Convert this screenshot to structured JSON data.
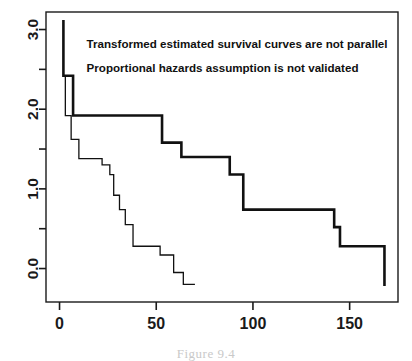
{
  "figure": {
    "caption_partial": "Figure 9.4",
    "annotations": [
      {
        "text": "Transformed estimated survival curves are not parallel",
        "x": 14,
        "y": 2.82
      },
      {
        "text": "Proportional hazards assumption is not validated",
        "x": 14,
        "y": 2.52
      }
    ]
  },
  "chart_data": {
    "type": "line",
    "title": "",
    "xlabel": "",
    "ylabel": "",
    "xlim": [
      -7,
      175
    ],
    "ylim": [
      -0.42,
      3.22
    ],
    "xticks": [
      0,
      50,
      100,
      150
    ],
    "yticks": [
      0.0,
      1.0,
      2.0,
      3.0
    ],
    "xtick_labels": [
      "0",
      "50",
      "100",
      "150"
    ],
    "ytick_labels": [
      "0.0",
      "1.0",
      "2.0",
      "3.0"
    ],
    "minor_yticks": [
      -0.5,
      0.5,
      1.5,
      2.5
    ],
    "grid": false,
    "legend": "none",
    "axis_color": "#1a1a1a",
    "series": [
      {
        "name": "group-1-thick",
        "style": "step",
        "linewidth": 2.6,
        "color": "#111111",
        "x": [
          2,
          2,
          4,
          4,
          7,
          7,
          12,
          12,
          53,
          53,
          63,
          63,
          88,
          88,
          95,
          95,
          142,
          142,
          145,
          145,
          168,
          168
        ],
        "y": [
          3.12,
          2.42,
          2.42,
          2.42,
          2.42,
          1.92,
          1.92,
          1.92,
          1.92,
          1.58,
          1.58,
          1.4,
          1.4,
          1.18,
          1.18,
          0.74,
          0.74,
          0.52,
          0.52,
          0.28,
          0.28,
          -0.22
        ]
      },
      {
        "name": "group-2-thin",
        "style": "step",
        "linewidth": 1.3,
        "color": "#111111",
        "x": [
          3,
          3,
          6,
          6,
          10,
          10,
          16,
          16,
          22,
          22,
          26,
          26,
          28,
          28,
          31,
          31,
          34,
          34,
          38,
          38,
          41,
          41,
          52,
          52,
          59,
          59,
          64,
          64,
          70
        ],
        "y": [
          2.42,
          1.92,
          1.92,
          1.62,
          1.62,
          1.38,
          1.38,
          1.38,
          1.38,
          1.3,
          1.3,
          1.18,
          1.18,
          0.92,
          0.92,
          0.74,
          0.74,
          0.55,
          0.55,
          0.28,
          0.28,
          0.28,
          0.28,
          0.17,
          0.17,
          -0.05,
          -0.05,
          -0.2,
          -0.2
        ]
      }
    ]
  }
}
